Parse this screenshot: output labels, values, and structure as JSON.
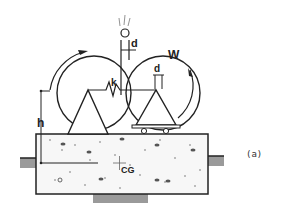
{
  "labels": {
    "d_top": "d",
    "d_right": "d",
    "w": "W",
    "k": "k",
    "h": "h",
    "cg": "CG",
    "caption": "(a)"
  },
  "colors": {
    "line": "#222222",
    "ground": "#999999",
    "slab_fill": "#f7f7f7"
  }
}
